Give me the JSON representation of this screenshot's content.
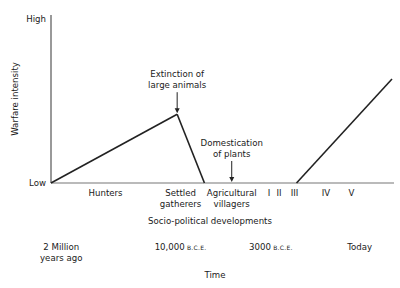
{
  "chart_data": {
    "type": "line",
    "title": "",
    "ylabel": "Warfare intensity",
    "xlabel": "Time",
    "secondary_xlabel": "Socio-political developments",
    "y_tick_labels": {
      "low": "Low",
      "high": "High"
    },
    "ylim": [
      0,
      1
    ],
    "x": [
      0,
      0.37,
      0.45,
      0.72,
      1.0
    ],
    "series": [
      {
        "name": "Warfare intensity",
        "points": [
          {
            "x": 0.0,
            "y": 0.0
          },
          {
            "x": 0.37,
            "y": 0.43
          },
          {
            "x": 0.45,
            "y": 0.0
          },
          {
            "x": 0.72,
            "y": 0.0
          },
          {
            "x": 1.0,
            "y": 0.65
          }
        ]
      }
    ],
    "annotations": [
      {
        "lines": [
          "Extinction of",
          "large animals"
        ],
        "x": 0.37,
        "y": 0.43
      },
      {
        "lines": [
          "Domestication",
          "of plants"
        ],
        "x": 0.53,
        "y": 0.0
      }
    ],
    "stage_labels": [
      {
        "lines": [
          "Hunters"
        ],
        "x": 0.16
      },
      {
        "lines": [
          "Settled",
          "gatherers"
        ],
        "x": 0.38
      },
      {
        "lines": [
          "Agricultural",
          "villagers"
        ],
        "x": 0.53
      },
      {
        "lines": [
          "I"
        ],
        "x": 0.639
      },
      {
        "lines": [
          "II"
        ],
        "x": 0.669
      },
      {
        "lines": [
          "III"
        ],
        "x": 0.714
      },
      {
        "lines": [
          "IV"
        ],
        "x": 0.806
      },
      {
        "lines": [
          "V"
        ],
        "x": 0.881
      }
    ],
    "time_labels": [
      {
        "main": "2 Million",
        "sub": "",
        "line2": "years ago",
        "x": 0.03
      },
      {
        "main": "10,000",
        "sub": "B.C.E.",
        "line2": "",
        "x": 0.38
      },
      {
        "main": "3000",
        "sub": "B.C.E.",
        "line2": "",
        "x": 0.645
      },
      {
        "main": "Today",
        "sub": "",
        "line2": "",
        "x": 0.905
      }
    ],
    "grid": false,
    "legend": "none"
  }
}
